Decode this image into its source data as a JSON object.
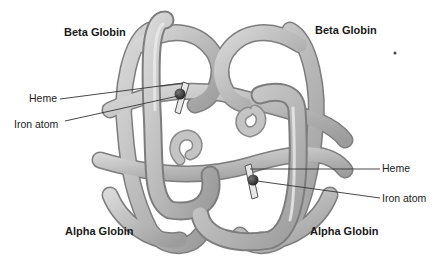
{
  "diagram": {
    "subunits": [
      {
        "label": "Beta Globin",
        "position": "top-left"
      },
      {
        "label": "Beta Globin",
        "position": "top-right"
      },
      {
        "label": "Alpha Globin",
        "position": "bottom-left"
      },
      {
        "label": "Alpha Globin",
        "position": "bottom-right"
      }
    ],
    "callouts_left": [
      {
        "label": "Heme"
      },
      {
        "label": "Iron atom"
      }
    ],
    "callouts_right": [
      {
        "label": "Heme"
      },
      {
        "label": "Iron atom"
      }
    ],
    "colors": {
      "tube": "#b9b9b9",
      "tube_shadow": "#8a8a8a",
      "tube_highlight": "#e6e6e6",
      "iron": "#333333",
      "leader_line": "#333333"
    }
  }
}
